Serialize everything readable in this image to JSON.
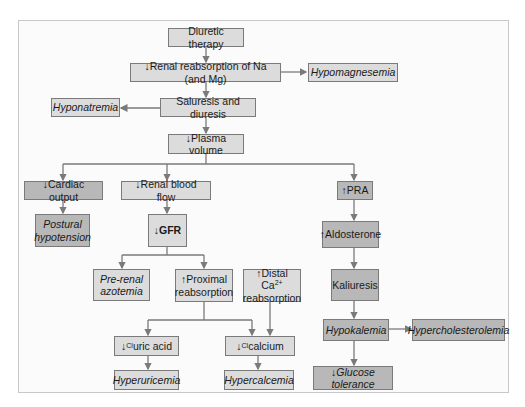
{
  "diagram": {
    "colors": {
      "light_box": "#dcdcdc",
      "dark_box": "#b8b8b8",
      "line": "#7a7a7a",
      "frame": "#c8c8c8"
    },
    "nodes": {
      "diuretic": "Diuretic therapy",
      "renal_reab": "↓Renal reabsorption of Na (and Mg)",
      "hypomag": "Hypomagnesemia",
      "hyponat": "Hyponatremia",
      "saluresis": "Saluresis and diuresis",
      "plasma": "↓Plasma volume",
      "cardiac": "↓Cardiac output",
      "postural_1": "Postural",
      "postural_2": "hypotension",
      "renal_blood": "↓Renal blood flow",
      "gfr": "↓GFR",
      "prerenal_1": "Pre-renal",
      "prerenal_2": "azotemia",
      "proximal_1": "↑Proximal",
      "proximal_2": "reabsorption",
      "distal_1": "↑Distal Ca",
      "distal_sup": "2+",
      "distal_2": "reabsorption",
      "uric_arrow": "↓",
      "uric_sup": "Cl",
      "uric_text": "uric acid",
      "calc_arrow": "↓",
      "calc_sup": "Cl",
      "calc_text": "calcium",
      "hyperuric": "Hyperuricemia",
      "hypercalc": "Hypercalcemia",
      "pra": "↑PRA",
      "aldo": "↑Aldosterone",
      "kaliuresis": "Kaliuresis",
      "hypokal": "Hypokalemia",
      "hyperchol": "Hypercholesterolemia",
      "glucose": "↓Glucose tolerance"
    }
  }
}
